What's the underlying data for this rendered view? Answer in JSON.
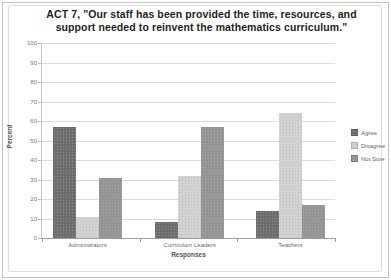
{
  "chart_data": {
    "type": "bar",
    "title": "ACT 7, \"Our staff has been provided the time, resources, and support needed to reinvent the mathematics curriculum.\"",
    "categories": [
      "Administrators",
      "Curriculum Leaders",
      "Teachers"
    ],
    "series": [
      {
        "name": "Agree",
        "color": "#6d6d6d",
        "values": [
          57,
          8,
          14
        ]
      },
      {
        "name": "Disagree",
        "color": "#d2d2d2",
        "values": [
          11,
          32,
          64
        ]
      },
      {
        "name": "Not Sure",
        "color": "#949494",
        "values": [
          31,
          57,
          17
        ]
      }
    ],
    "xlabel": "Responses",
    "ylabel": "Percent",
    "ylim": [
      0,
      100
    ],
    "ytick_step": 10,
    "grid": true,
    "legend_position": "right"
  }
}
